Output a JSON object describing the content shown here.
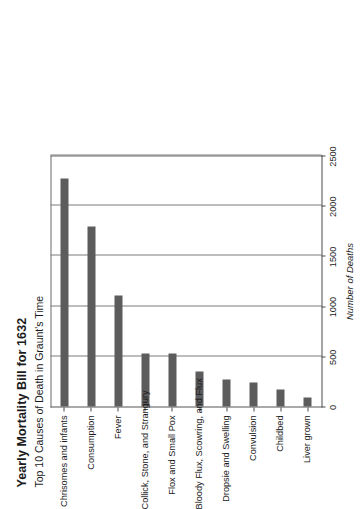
{
  "chart_data": {
    "type": "bar",
    "orientation": "vertical",
    "title": "Yearly Mortality Bill for 1632",
    "subtitle": "Top 10 Causes of Death in Graunt's Time",
    "xlabel": "",
    "ylabel": "Number of Deaths",
    "categories": [
      "Chrisomes and infants",
      "Consumption",
      "Fever",
      "Collick, Stone, and Strangury",
      "Flox and Small Pox",
      "Bloody Flux, Scowring, and Flux",
      "Dropsie and Swelling",
      "Convulsion",
      "Childbed",
      "Liver grown"
    ],
    "values": [
      2268,
      1797,
      1108,
      531,
      531,
      348,
      267,
      241,
      171,
      87
    ],
    "ylim": [
      0,
      2500
    ],
    "yticks": [
      0,
      500,
      1000,
      1500,
      2000,
      2500
    ],
    "ytick_labels": [
      "0",
      "500",
      "1000",
      "1500",
      "2000",
      "2500"
    ],
    "grid": true,
    "legend": false,
    "bar_color": "#5c5c5c",
    "grid_color": "#7d7d7d",
    "axis_color": "#4a4a4a",
    "background": "#ffffff",
    "page_rotation_degrees": -90
  }
}
